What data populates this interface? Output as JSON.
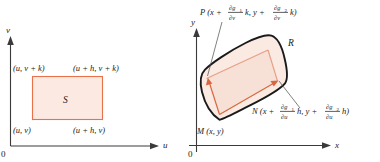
{
  "figure": {
    "colors": {
      "rect_stroke": "#E8734A",
      "rect_fill": "#FBE9E2",
      "blob_stroke": "#1a1a1a",
      "blob_fill": "#FAEAE2",
      "vector": "#D9663F",
      "axis": "#3a3a3a",
      "text": "#1a1a1a"
    }
  },
  "left_panel": {
    "name": "uv-plane",
    "axes": {
      "x_label": "u",
      "y_label": "v",
      "origin_label": "0"
    },
    "region_label": "S",
    "corner_labels": {
      "bottom_left": "(u, v)",
      "bottom_right": "(u + h, v)",
      "top_left": "(u, v + k)",
      "top_right": "(u + h, v + k)"
    }
  },
  "right_panel": {
    "name": "xy-plane",
    "axes": {
      "x_label": "x",
      "y_label": "y",
      "origin_label": "0"
    },
    "region_label": "R",
    "points": {
      "M": {
        "name": "M",
        "label": "M (x, y)",
        "coord_x": "x",
        "coord_y": "y"
      },
      "N": {
        "name": "N",
        "prefix": "N (x +",
        "frac1_num": "∂g",
        "frac1_num_sub": "1",
        "frac1_den": "∂u",
        "term1_suffix": "h, y +",
        "frac2_num": "∂g",
        "frac2_num_sub": "2",
        "frac2_den": "∂u",
        "term2_suffix": "h)",
        "full_text": "N (x + ∂g₁/∂u h, y + ∂g₂/∂u h)"
      },
      "P": {
        "name": "P",
        "prefix": "P (x +",
        "frac1_num": "∂g",
        "frac1_num_sub": "1",
        "frac1_den": "∂v",
        "term1_suffix": "k, y +",
        "frac2_num": "∂g",
        "frac2_num_sub": "2",
        "frac2_den": "∂v",
        "term2_suffix": "k)",
        "full_text": "P (x + ∂g₁/∂v k, y + ∂g₂/∂v k)"
      }
    }
  }
}
